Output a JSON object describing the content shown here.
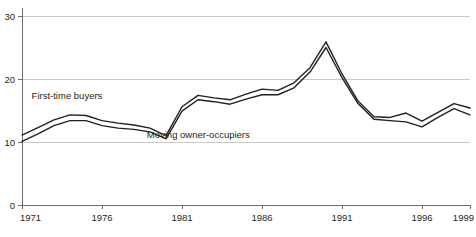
{
  "chart_data": {
    "type": "line",
    "title": "",
    "subtitle": "",
    "xlabel": "",
    "ylabel": "",
    "xlim": [
      1971,
      1999
    ],
    "ylim": [
      0,
      30
    ],
    "grid": true,
    "gridlines_y": [
      10,
      20,
      30
    ],
    "legend_position": "inline-annotations",
    "y_ticks": [
      "0",
      "10",
      "20",
      "30"
    ],
    "y_tick_values": [
      0,
      10,
      20,
      30
    ],
    "x_ticks": [
      "1971",
      "1976",
      "1981",
      "1986",
      "1991",
      "1996",
      "1999"
    ],
    "x_tick_values": [
      1971,
      1976,
      1981,
      1986,
      1991,
      1996,
      1999
    ],
    "x": [
      1971,
      1972,
      1973,
      1974,
      1975,
      1976,
      1977,
      1978,
      1979,
      1980,
      1981,
      1982,
      1983,
      1984,
      1985,
      1986,
      1987,
      1988,
      1989,
      1990,
      1991,
      1992,
      1993,
      1994,
      1995,
      1996,
      1997,
      1998,
      1999
    ],
    "series": [
      {
        "name": "First-time buyers",
        "label": "First-time buyers",
        "label_x": 1971.6,
        "label_y": 16.9,
        "values": [
          11.1,
          12.3,
          13.5,
          14.3,
          14.2,
          13.4,
          13.0,
          12.7,
          12.2,
          11.0,
          15.6,
          17.4,
          17.0,
          16.7,
          17.6,
          18.4,
          18.2,
          19.4,
          21.8,
          25.9,
          20.8,
          16.5,
          14.0,
          13.9,
          14.6,
          13.3,
          14.7,
          16.1,
          15.4
        ]
      },
      {
        "name": "Moving owner-occupiers",
        "label": "Moving owner-occupiers",
        "label_x": 1978.8,
        "label_y": 10.6,
        "values": [
          10.1,
          11.3,
          12.6,
          13.4,
          13.4,
          12.6,
          12.2,
          12.0,
          11.6,
          10.5,
          14.9,
          16.7,
          16.4,
          16.0,
          16.8,
          17.5,
          17.5,
          18.6,
          21.1,
          25.0,
          20.2,
          16.1,
          13.6,
          13.4,
          13.2,
          12.4,
          13.9,
          15.3,
          14.3
        ]
      }
    ]
  }
}
